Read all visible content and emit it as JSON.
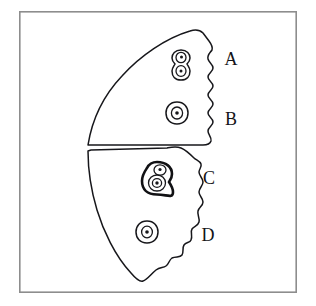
{
  "figure": {
    "background_color": "#ffffff",
    "frame": {
      "name": "outer frame border",
      "stroke_color": "#8d8d8d",
      "x": 19,
      "y": 11,
      "width": 278,
      "height": 282
    },
    "ink_color": "#17171b"
  },
  "labels": [
    {
      "id": "A",
      "text": "A",
      "x": 231,
      "y": 61
    },
    {
      "id": "B",
      "text": "B",
      "x": 231,
      "y": 121
    },
    {
      "id": "C",
      "text": "C",
      "x": 209,
      "y": 180
    },
    {
      "id": "D",
      "text": "D",
      "x": 208,
      "y": 237
    }
  ],
  "regions": [
    {
      "id": "upper-region",
      "name": "upper region",
      "labels": [
        "A",
        "B"
      ],
      "right_margin": "wavy",
      "outline_path": "M 88 145 C 92 120 104 95 122 76 C 140 56 166 38 190 31 C 196 29 200 30 203 33 L 209 41 C 212 45 213 47 212 50 C 210 53 207 55 208 59 C 209 63 213 64 213 68 C 213 72 208 73 208 77 C 208 81 213 82 213 86 C 213 90 208 91 208 95 C 208 99 213 100 213 104 C 213 108 208 109 208 113 C 208 117 213 118 213 122 C 213 126 208 127 208 131 C 208 135 212 137 211 141 C 210 144 207 145 203 145 Z"
    },
    {
      "id": "lower-region",
      "name": "lower region",
      "labels": [
        "C",
        "D"
      ],
      "right_margin": "wavy",
      "outline_path": "M 88 151 C 88 168 91 190 97 210 C 103 230 115 256 131 273 C 136 279 140 282 143 281 C 147 280 151 274 156 270 C 160 267 163 268 166 266 C 169 264 169 260 172 258 C 176 256 180 258 182 255 C 184 252 182 248 184 245 C 186 242 190 243 191 240 C 193 236 190 232 192 229 C 194 226 198 226 199 222 C 200 218 197 215 198 211 C 199 207 203 206 203 202 C 203 198 199 196 199 192 C 199 188 203 186 203 182 C 203 178 199 176 199 172 C 199 169 202 167 201 164 C 200 161 196 160 194 158 C 190 154 186 150 181 148 C 176 146 172 147 167 148 L 91 150 Z"
    }
  ],
  "cells": [
    {
      "id": "cell-a",
      "name": "paired cell in upper region",
      "label_context": "A",
      "type": "doublet",
      "x": 181,
      "y": 63,
      "nucleus_count": 2
    },
    {
      "id": "cell-b",
      "name": "single cell in upper region",
      "label_context": "B",
      "type": "single",
      "x": 177,
      "y": 113,
      "nucleus_count": 1
    },
    {
      "id": "cell-c",
      "name": "bold cell cluster in lower region",
      "label_context": "C",
      "type": "cluster",
      "x": 157,
      "y": 178,
      "nucleus_count": 2
    },
    {
      "id": "cell-d",
      "name": "single cell in lower region",
      "label_context": "D",
      "type": "single",
      "x": 147,
      "y": 232,
      "nucleus_count": 1
    }
  ]
}
